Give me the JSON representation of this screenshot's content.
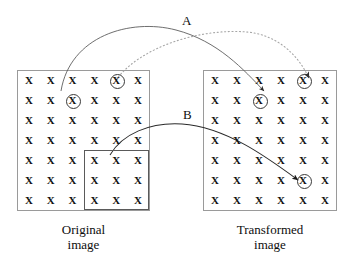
{
  "figure": {
    "background_color": "#ffffff",
    "ink_color": "#111111",
    "line_color": "#3a3a3a",
    "dotted_color": "#9b9b9b"
  },
  "panels": {
    "original": {
      "caption_line1": "Original",
      "caption_line2": "image",
      "rows": 7,
      "cols": 6,
      "cell_glyph": "X",
      "circled_cells": [
        {
          "row": 1,
          "col": 5
        },
        {
          "row": 2,
          "col": 3
        }
      ],
      "selection_box": {
        "row_start": 5,
        "row_end": 7,
        "col_start": 4,
        "col_end": 6
      }
    },
    "transformed": {
      "caption_line1": "Transformed",
      "caption_line2": "image",
      "rows": 7,
      "cols": 6,
      "cell_glyph": "X",
      "circled_cells": [
        {
          "row": 1,
          "col": 5
        },
        {
          "row": 2,
          "col": 3
        },
        {
          "row": 6,
          "col": 5
        }
      ]
    }
  },
  "arcs": {
    "a_label": "A",
    "b_label": "B",
    "solid_upper": {
      "style": "solid",
      "from": "original row2 col3 circled X",
      "to": "transformed row2 col3 circled X"
    },
    "dotted_upper": {
      "style": "dotted",
      "from": "original row1 col5 circled X",
      "to": "transformed row1 col5 circled X"
    },
    "solid_lower": {
      "style": "solid",
      "from": "original selection box top-left corner",
      "to": "transformed row6 col5 circled X"
    }
  }
}
